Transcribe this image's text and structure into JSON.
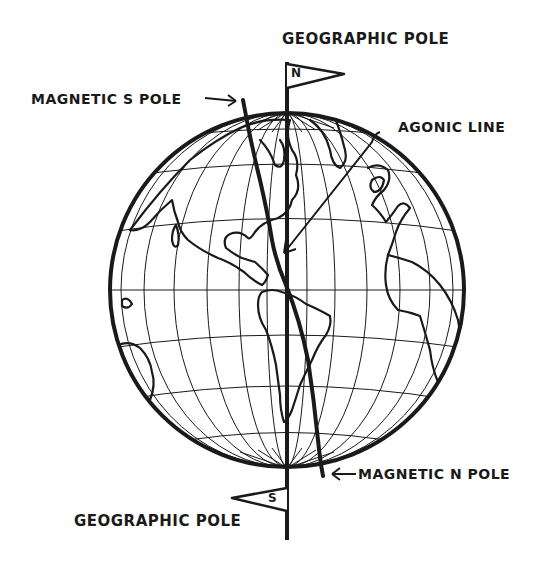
{
  "diagram": {
    "type": "globe-magnetic-poles",
    "colors": {
      "ink": "#1a1a1a",
      "background": "#ffffff"
    },
    "labels": {
      "geographic_pole_top": "GEOGRAPHIC POLE",
      "magnetic_s_pole": "MAGNETIC S POLE",
      "agonic_line": "AGONIC LINE",
      "magnetic_n_pole": "MAGNETIC N POLE",
      "geographic_pole_bottom": "GEOGRAPHIC POLE"
    },
    "flags": {
      "north": "N",
      "south": "S"
    },
    "arrows": {
      "magnetic_s_pole_arrow": "→",
      "magnetic_n_pole_arrow": "←"
    }
  }
}
